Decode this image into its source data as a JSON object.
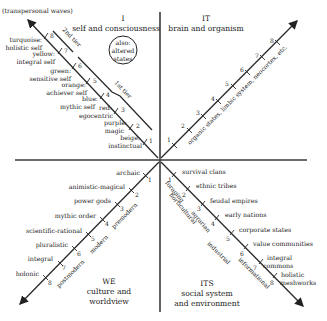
{
  "quadrants": {
    "ul": {
      "numeral": "I",
      "title": "self and consciousness"
    },
    "ur": {
      "numeral": "IT",
      "title": "brain and organism"
    },
    "ll": {
      "numeral": "WE",
      "title_line1": "culture and",
      "title_line2": "worldview"
    },
    "lr": {
      "numeral": "ITS",
      "title_line1": "social system",
      "title_line2": "and environment"
    }
  },
  "ul": {
    "arrow_label": "(transpersonal waves)",
    "altered_states": [
      "also:",
      "altered",
      "states"
    ],
    "tiers": [
      "2nd tier",
      "1st tier"
    ],
    "levels": [
      {
        "n": "1",
        "line1": "beige:",
        "line2": "instinctual"
      },
      {
        "n": "2",
        "line1": "purple:",
        "line2": "magic"
      },
      {
        "n": "3",
        "line1": "red:",
        "line2": "egocentric"
      },
      {
        "n": "4",
        "line1": "blue:",
        "line2": "mythic self"
      },
      {
        "n": "5",
        "line1": "orange:",
        "line2": "achiever self"
      },
      {
        "n": "6",
        "line1": "green:",
        "line2": "sensitive self"
      },
      {
        "n": "7",
        "line1": "yellow:",
        "line2": "integral self"
      },
      {
        "n": "8",
        "line1": "turquoise:",
        "line2": "holistic self"
      }
    ]
  },
  "ur": {
    "axis_label": "organic states, limbic system, neocortex, etc.",
    "levels": [
      "1",
      "2",
      "3",
      "4",
      "5",
      "6",
      "7",
      "8"
    ]
  },
  "ll": {
    "levels": [
      {
        "n": "1",
        "label": "archaic"
      },
      {
        "n": "2",
        "label": "animistic-magical"
      },
      {
        "n": "3",
        "label": "power gods"
      },
      {
        "n": "4",
        "label": "mythic order"
      },
      {
        "n": "5",
        "label": "scientific-rational"
      },
      {
        "n": "6",
        "label": "pluralistic"
      },
      {
        "n": "7",
        "label": "integral"
      },
      {
        "n": "8",
        "label": "holonic"
      }
    ],
    "eras": [
      "premodern",
      "modern",
      "postmodern"
    ]
  },
  "lr": {
    "levels": [
      {
        "n": "1",
        "line1": "survival clans",
        "line2": ""
      },
      {
        "n": "2",
        "line1": "ethnic tribes",
        "line2": ""
      },
      {
        "n": "3",
        "line1": "feudal empires",
        "line2": ""
      },
      {
        "n": "4",
        "line1": "early nations",
        "line2": ""
      },
      {
        "n": "5",
        "line1": "corporate states",
        "line2": ""
      },
      {
        "n": "6",
        "line1": "value communities",
        "line2": ""
      },
      {
        "n": "7",
        "line1": "integral",
        "line2": "commons"
      },
      {
        "n": "8",
        "line1": "holistic",
        "line2": "meshworks"
      }
    ],
    "modes": [
      "foraging",
      "horticultural",
      "agrarian",
      "industrial",
      "informational"
    ]
  }
}
